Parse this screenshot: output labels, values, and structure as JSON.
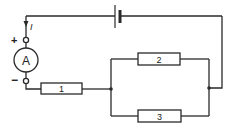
{
  "diagram": {
    "type": "circuit",
    "colors": {
      "line": "#2a2a2a",
      "background": "#ffffff"
    },
    "current_label": "I",
    "ammeter": {
      "label": "A",
      "plus": "+",
      "minus": "−"
    },
    "resistors": [
      {
        "id": "r1",
        "label": "1"
      },
      {
        "id": "r2",
        "label": "2"
      },
      {
        "id": "r3",
        "label": "3"
      }
    ],
    "battery": {
      "name": "battery"
    }
  }
}
